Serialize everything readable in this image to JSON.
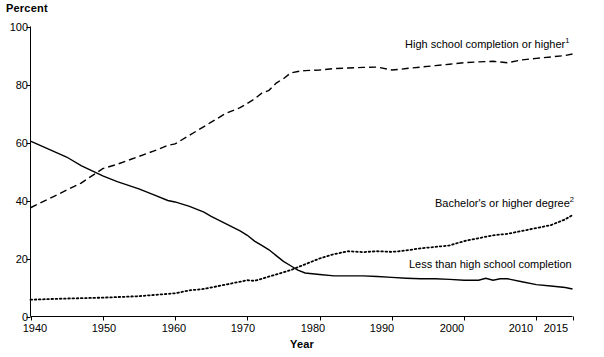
{
  "chart_data": {
    "type": "line",
    "title": "",
    "subtitle": "",
    "xlabel": "Year",
    "ylabel": "Percent",
    "xlim": [
      1940,
      2015
    ],
    "ylim": [
      0,
      100
    ],
    "grid": false,
    "legend_position": "inline-annotations",
    "yticks": [
      "0",
      "20",
      "40",
      "60",
      "80",
      "100"
    ],
    "ytick_values": [
      0,
      20,
      40,
      60,
      80,
      100
    ],
    "xticks": [
      "1940",
      "1950",
      "1960",
      "1970",
      "1980",
      "1990",
      "2000",
      "2010",
      "2015"
    ],
    "xtick_values": [
      1940,
      1950,
      1960,
      1970,
      1980,
      1990,
      2000,
      2010,
      2015
    ],
    "series": [
      {
        "name": "High school completion or higher",
        "style": "dashed",
        "annotation": "High school completion or higher",
        "annotation_superscript": "1",
        "x": [
          1940,
          1947,
          1950,
          1952,
          1957,
          1959,
          1960,
          1962,
          1964,
          1965,
          1967,
          1969,
          1970,
          1971,
          1972,
          1973,
          1974,
          1975,
          1976,
          1977,
          1978,
          1980,
          1982,
          1984,
          1986,
          1988,
          1990,
          1991,
          1992,
          1994,
          1996,
          1998,
          2000,
          2002,
          2004,
          2006,
          2008,
          2010,
          2012,
          2014,
          2015
        ],
        "y": [
          37.5,
          46.0,
          51.0,
          52.5,
          57.0,
          59.0,
          59.5,
          62.5,
          65.5,
          67.0,
          70.0,
          72.0,
          73.5,
          75.0,
          77.0,
          78.0,
          80.5,
          82.0,
          84.0,
          84.5,
          84.8,
          85.0,
          85.5,
          85.7,
          85.9,
          86.0,
          85.0,
          85.2,
          85.5,
          86.0,
          86.5,
          87.0,
          87.5,
          87.8,
          88.0,
          87.5,
          88.5,
          89.0,
          89.5,
          90.0,
          90.5
        ]
      },
      {
        "name": "Bachelor's or higher degree",
        "style": "dotted",
        "annotation": "Bachelor's or higher degree",
        "annotation_superscript": "2",
        "x": [
          1940,
          1945,
          1950,
          1955,
          1960,
          1962,
          1964,
          1966,
          1968,
          1970,
          1971,
          1972,
          1974,
          1976,
          1977,
          1978,
          1980,
          1982,
          1984,
          1986,
          1988,
          1990,
          1991,
          1992,
          1994,
          1996,
          1998,
          2000,
          2002,
          2004,
          2006,
          2008,
          2010,
          2012,
          2014,
          2015
        ],
        "y": [
          5.8,
          6.2,
          6.5,
          7.0,
          8.0,
          9.0,
          9.5,
          10.5,
          11.5,
          12.5,
          12.3,
          13.0,
          14.5,
          16.0,
          17.0,
          18.0,
          20.0,
          21.5,
          22.5,
          22.2,
          22.5,
          22.3,
          22.5,
          22.8,
          23.5,
          24.0,
          24.5,
          26.0,
          27.0,
          28.0,
          28.5,
          29.5,
          30.5,
          31.5,
          33.5,
          35.0
        ]
      },
      {
        "name": "Less than high school completion",
        "style": "solid",
        "annotation": "Less than high school completion",
        "annotation_superscript": "",
        "x": [
          1940,
          1945,
          1947,
          1950,
          1952,
          1955,
          1957,
          1959,
          1960,
          1962,
          1964,
          1965,
          1967,
          1969,
          1970,
          1971,
          1972,
          1973,
          1974,
          1975,
          1976,
          1977,
          1978,
          1980,
          1982,
          1984,
          1986,
          1988,
          1990,
          1992,
          1994,
          1996,
          1998,
          2000,
          2002,
          2003,
          2004,
          2005,
          2006,
          2008,
          2010,
          2012,
          2014,
          2015
        ],
        "y": [
          60.5,
          55.0,
          52.0,
          48.5,
          46.5,
          44.0,
          42.0,
          40.0,
          39.5,
          38.0,
          36.0,
          34.5,
          32.0,
          29.5,
          28.0,
          26.0,
          24.5,
          23.0,
          21.0,
          19.0,
          17.5,
          16.0,
          15.0,
          14.5,
          14.0,
          14.0,
          14.0,
          13.8,
          13.5,
          13.2,
          13.0,
          13.0,
          12.8,
          12.5,
          12.5,
          13.2,
          12.5,
          13.0,
          13.0,
          12.0,
          11.0,
          10.5,
          10.0,
          9.5
        ]
      }
    ]
  },
  "axis": {
    "ylabel": "Percent",
    "xlabel": "Year"
  },
  "annotations": {
    "hs": "High school completion or higher",
    "hs_sup": "1",
    "ba": "Bachelor's or higher degree",
    "ba_sup": "2",
    "lths": "Less than high school completion"
  }
}
